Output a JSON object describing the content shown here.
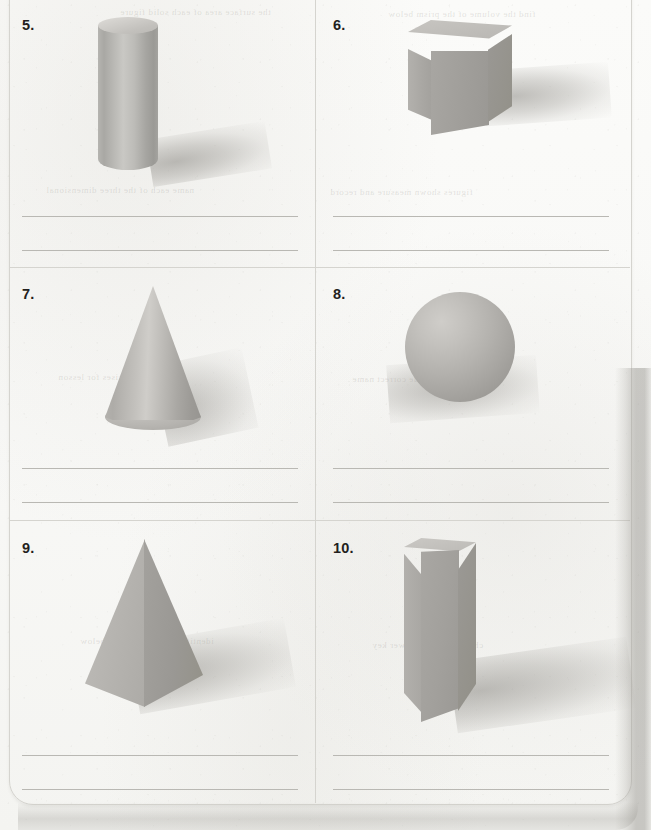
{
  "page": {
    "kind": "math-worksheet-page",
    "background_color": "#f8f8f6",
    "border_color": "#d5d4cf",
    "rule_color": "#b9b8b3"
  },
  "bleed_through": [
    {
      "text": "the surface area of each solid figure",
      "x": 120,
      "y": 7
    },
    {
      "text": "find the volume of the prism below",
      "x": 388,
      "y": 9
    },
    {
      "text": "name each of the three dimensional",
      "x": 46,
      "y": 185
    },
    {
      "text": "figures shown measure and record",
      "x": 330,
      "y": 187
    },
    {
      "text": "practice exercises for lesson",
      "x": 58,
      "y": 372
    },
    {
      "text": "write the correct name",
      "x": 352,
      "y": 374
    },
    {
      "text": "identify each solid figure below",
      "x": 80,
      "y": 636
    },
    {
      "text": "chapter review answer key",
      "x": 372,
      "y": 640
    }
  ],
  "grid": {
    "column_divider_x": 315,
    "row_dividers_y": [
      267,
      520
    ],
    "rows": 3,
    "columns": 2
  },
  "cells": [
    {
      "number_label": "5.",
      "shape_name": "cylinder-icon",
      "shape_type": "cylinder",
      "column": "left",
      "row": 1,
      "answer_lines": 2,
      "answer_values": [
        "",
        ""
      ]
    },
    {
      "number_label": "6.",
      "shape_name": "cube-icon",
      "shape_type": "cube",
      "column": "right",
      "row": 1,
      "answer_lines": 2,
      "answer_values": [
        "",
        ""
      ]
    },
    {
      "number_label": "7.",
      "shape_name": "cone-icon",
      "shape_type": "cone",
      "column": "left",
      "row": 2,
      "answer_lines": 2,
      "answer_values": [
        "",
        ""
      ]
    },
    {
      "number_label": "8.",
      "shape_name": "sphere-icon",
      "shape_type": "sphere",
      "column": "right",
      "row": 2,
      "answer_lines": 2,
      "answer_values": [
        "",
        ""
      ]
    },
    {
      "number_label": "9.",
      "shape_name": "pyramid-icon",
      "shape_type": "square-pyramid",
      "column": "left",
      "row": 3,
      "answer_lines": 2,
      "answer_values": [
        "",
        ""
      ]
    },
    {
      "number_label": "10.",
      "shape_name": "rectangular-prism-icon",
      "shape_type": "rectangular-prism",
      "column": "right",
      "row": 3,
      "answer_lines": 2,
      "answer_values": [
        "",
        ""
      ]
    }
  ],
  "colors": {
    "solid_light": "#c9c8c4",
    "solid_mid": "#b0aeaa",
    "solid_dark": "#95938f",
    "shadow": "#b8b6b1",
    "ink": "#231f20"
  }
}
